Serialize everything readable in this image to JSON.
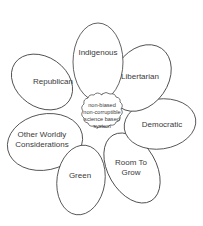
{
  "diagram": {
    "type": "flower",
    "center": {
      "lines": [
        "non-biased",
        "non-corruptible",
        "science based",
        "system"
      ]
    },
    "petals": [
      {
        "label": "Indigenous"
      },
      {
        "label": "Libertarian"
      },
      {
        "label": "Democratic"
      },
      {
        "label_lines": [
          "Room To",
          "Grow"
        ]
      },
      {
        "label": "Green"
      },
      {
        "label_lines": [
          "Other Worldly",
          "Considerations"
        ]
      },
      {
        "label": "Republican"
      }
    ],
    "colors": {
      "stroke": "#3a3a3a",
      "fill": "#ffffff",
      "text": "#3a3a3a"
    }
  }
}
